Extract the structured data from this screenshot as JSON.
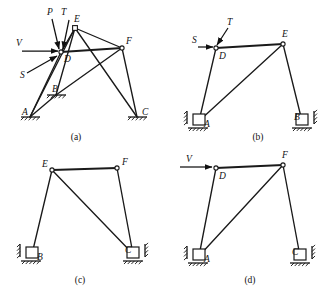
{
  "figure": {
    "background_color": "#ffffff",
    "ink_color": "#1a1a1a",
    "width": 331,
    "height": 293
  },
  "panels": [
    {
      "id": "a",
      "caption": "(a)",
      "caption_pos": {
        "x": 76,
        "y": 140
      },
      "description": "Complete frame with joints A, B, C, D, E, F and applied loads P, T, V, S at joint D",
      "joints": [
        {
          "name": "A",
          "x": 30,
          "y": 117,
          "label_x": 22,
          "label_y": 115,
          "marker": "none"
        },
        {
          "name": "B",
          "x": 56,
          "y": 95,
          "label_x": 52,
          "label_y": 92,
          "marker": "none"
        },
        {
          "name": "C",
          "x": 137,
          "y": 117,
          "label_x": 142,
          "label_y": 115,
          "marker": "none"
        },
        {
          "name": "D",
          "x": 61,
          "y": 52,
          "label_x": 64,
          "label_y": 62,
          "marker": "circle"
        },
        {
          "name": "E",
          "x": 75,
          "y": 28,
          "label_x": 74,
          "label_y": 22,
          "marker": "square"
        },
        {
          "name": "F",
          "x": 122,
          "y": 48,
          "label_x": 126,
          "label_y": 44,
          "marker": "circle"
        }
      ],
      "members": [
        {
          "from": "A",
          "to": "D"
        },
        {
          "from": "A",
          "to": "E"
        },
        {
          "from": "A",
          "to": "B"
        },
        {
          "from": "B",
          "to": "E"
        },
        {
          "from": "B",
          "to": "F"
        },
        {
          "from": "D",
          "to": "E"
        },
        {
          "from": "D",
          "to": "F"
        },
        {
          "from": "E",
          "to": "F"
        },
        {
          "from": "E",
          "to": "C"
        },
        {
          "from": "F",
          "to": "C"
        }
      ],
      "forces": [
        {
          "name": "P",
          "label_x": 47,
          "label_y": 15,
          "type": "arrow",
          "x1": 52,
          "y1": 19,
          "x2": 59,
          "y2": 49
        },
        {
          "name": "T",
          "label_x": 61,
          "label_y": 15,
          "type": "arrow",
          "x1": 69,
          "y1": 20,
          "x2": 63,
          "y2": 49
        },
        {
          "name": "V",
          "label_x": 16,
          "label_y": 46,
          "type": "arrow",
          "x1": 22,
          "y1": 51,
          "x2": 58,
          "y2": 51
        },
        {
          "name": "S",
          "label_x": 20,
          "label_y": 78,
          "type": "arrow",
          "x1": 27,
          "y1": 73,
          "x2": 57,
          "y2": 56
        }
      ],
      "supports": [
        {
          "at": "A",
          "kind": "pinned-ground",
          "x": 30,
          "y": 117
        },
        {
          "at": "B",
          "kind": "pinned-ground",
          "x": 56,
          "y": 95
        },
        {
          "at": "C",
          "kind": "pinned-ground",
          "x": 137,
          "y": 117
        }
      ]
    },
    {
      "id": "b",
      "caption": "(b)",
      "caption_pos": {
        "x": 258,
        "y": 140
      },
      "description": "Sub-frame A-D-E-B with loads S and T applied at joint D",
      "joints": [
        {
          "name": "A",
          "x": 199,
          "y": 121,
          "label_x": 204,
          "label_y": 127,
          "marker": "none"
        },
        {
          "name": "B",
          "x": 302,
          "y": 121,
          "label_x": 294,
          "label_y": 120,
          "marker": "none"
        },
        {
          "name": "D",
          "x": 216,
          "y": 48,
          "label_x": 219,
          "label_y": 59,
          "marker": "circle"
        },
        {
          "name": "E",
          "x": 283,
          "y": 44,
          "label_x": 282,
          "label_y": 37,
          "marker": "circle"
        }
      ],
      "members": [
        {
          "from": "A",
          "to": "D"
        },
        {
          "from": "A",
          "to": "E"
        },
        {
          "from": "D",
          "to": "E"
        },
        {
          "from": "E",
          "to": "B"
        }
      ],
      "forces": [
        {
          "name": "T",
          "label_x": 227,
          "label_y": 25,
          "type": "arrow",
          "x1": 228,
          "y1": 28,
          "x2": 217,
          "y2": 45
        },
        {
          "name": "S",
          "label_x": 192,
          "label_y": 43,
          "type": "arrow",
          "x1": 198,
          "y1": 47,
          "x2": 213,
          "y2": 47
        }
      ],
      "supports": [
        {
          "at": "A",
          "kind": "box-left-ground",
          "x": 199,
          "y": 121
        },
        {
          "at": "B",
          "kind": "box-right-ground",
          "x": 302,
          "y": 121
        }
      ]
    },
    {
      "id": "c",
      "caption": "(c)",
      "caption_pos": {
        "x": 80,
        "y": 283
      },
      "description": "Sub-frame B-E-F-C, no applied external loads shown",
      "joints": [
        {
          "name": "B",
          "x": 32,
          "y": 254,
          "label_x": 37,
          "label_y": 260,
          "marker": "none"
        },
        {
          "name": "C",
          "x": 133,
          "y": 254,
          "label_x": 125,
          "label_y": 253,
          "marker": "none"
        },
        {
          "name": "E",
          "x": 52,
          "y": 170,
          "label_x": 42,
          "label_y": 167,
          "marker": "circle"
        },
        {
          "name": "F",
          "x": 117,
          "y": 168,
          "label_x": 122,
          "label_y": 165,
          "marker": "circle"
        }
      ],
      "members": [
        {
          "from": "B",
          "to": "E"
        },
        {
          "from": "E",
          "to": "F"
        },
        {
          "from": "E",
          "to": "C"
        },
        {
          "from": "F",
          "to": "C"
        }
      ],
      "forces": [],
      "supports": [
        {
          "at": "B",
          "kind": "box-left-ground",
          "x": 32,
          "y": 254
        },
        {
          "at": "C",
          "kind": "box-right-ground",
          "x": 133,
          "y": 254
        }
      ]
    },
    {
      "id": "d",
      "caption": "(d)",
      "caption_pos": {
        "x": 250,
        "y": 283
      },
      "description": "Sub-frame A-D-F-C with horizontal load V applied at joint D",
      "joints": [
        {
          "name": "A",
          "x": 199,
          "y": 256,
          "label_x": 204,
          "label_y": 262,
          "marker": "none"
        },
        {
          "name": "C",
          "x": 300,
          "y": 256,
          "label_x": 292,
          "label_y": 255,
          "marker": "none"
        },
        {
          "name": "D",
          "x": 216,
          "y": 168,
          "label_x": 219,
          "label_y": 179,
          "marker": "circle"
        },
        {
          "name": "F",
          "x": 283,
          "y": 165,
          "label_x": 282,
          "label_y": 158,
          "marker": "circle"
        }
      ],
      "members": [
        {
          "from": "A",
          "to": "D"
        },
        {
          "from": "A",
          "to": "F"
        },
        {
          "from": "D",
          "to": "F"
        },
        {
          "from": "F",
          "to": "C"
        }
      ],
      "forces": [
        {
          "name": "V",
          "label_x": 186,
          "label_y": 162,
          "type": "arrow",
          "x1": 180,
          "y1": 167,
          "x2": 212,
          "y2": 167
        }
      ],
      "supports": [
        {
          "at": "A",
          "kind": "box-left-ground",
          "x": 199,
          "y": 256
        },
        {
          "at": "C",
          "kind": "box-right-ground",
          "x": 300,
          "y": 256
        }
      ]
    }
  ]
}
